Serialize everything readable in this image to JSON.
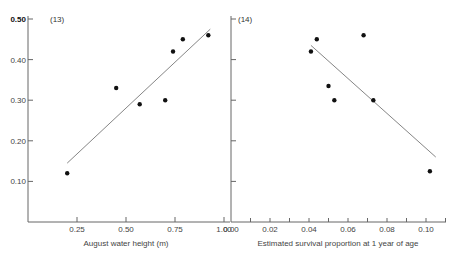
{
  "chart_data": [
    {
      "type": "scatter",
      "panel_label": "(13)",
      "title": "",
      "xlabel": "August water height (m)",
      "ylabel": "",
      "xlim": [
        0,
        1.0
      ],
      "ylim": [
        0,
        0.5
      ],
      "x_ticks": [
        "0.25",
        "0.50",
        "0.75",
        "1.00"
      ],
      "y_ticks": [
        "0.50",
        "0.40",
        "0.30",
        "0.20",
        "0.10"
      ],
      "grid": false,
      "points": [
        {
          "x": 0.2,
          "y": 0.12
        },
        {
          "x": 0.45,
          "y": 0.33
        },
        {
          "x": 0.57,
          "y": 0.29
        },
        {
          "x": 0.7,
          "y": 0.3
        },
        {
          "x": 0.74,
          "y": 0.42
        },
        {
          "x": 0.79,
          "y": 0.45
        },
        {
          "x": 0.92,
          "y": 0.46
        }
      ],
      "fit_line": {
        "x1": 0.2,
        "y1": 0.145,
        "x2": 0.93,
        "y2": 0.475
      }
    },
    {
      "type": "scatter",
      "panel_label": "(14)",
      "title": "",
      "xlabel": "Estimated survival proportion at 1 year of age",
      "ylabel": "",
      "xlim": [
        0,
        0.11
      ],
      "ylim": [
        0,
        0.5
      ],
      "x_ticks": [
        "0.00",
        "0.02",
        "0.04",
        "0.06",
        "0.08",
        "0.10"
      ],
      "y_ticks": [],
      "grid": false,
      "points": [
        {
          "x": 0.041,
          "y": 0.42
        },
        {
          "x": 0.044,
          "y": 0.45
        },
        {
          "x": 0.05,
          "y": 0.335
        },
        {
          "x": 0.053,
          "y": 0.3
        },
        {
          "x": 0.068,
          "y": 0.46
        },
        {
          "x": 0.073,
          "y": 0.3
        },
        {
          "x": 0.102,
          "y": 0.125
        }
      ],
      "fit_line": {
        "x1": 0.041,
        "y1": 0.435,
        "x2": 0.105,
        "y2": 0.16
      }
    }
  ]
}
